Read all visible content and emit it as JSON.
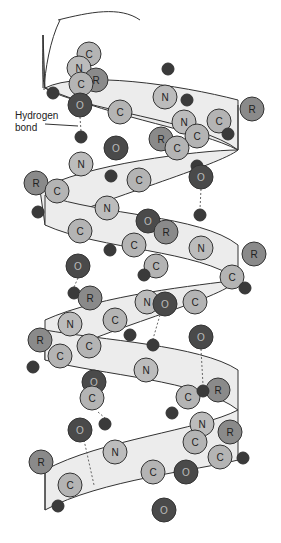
{
  "annotation": {
    "line1": "Hydrogen",
    "line2": "bond"
  },
  "colors": {
    "C": "#b4b4b4",
    "N": "#bcbcbc",
    "O": "#4a4a4a",
    "R": "#8a8a8a",
    "H": "#3a3a3a",
    "ribbon": "#ececec",
    "stroke": "#333333"
  },
  "atoms": [
    {
      "t": "C",
      "x": 89,
      "y": 54,
      "r": 12
    },
    {
      "t": "N",
      "x": 79,
      "y": 68,
      "r": 12
    },
    {
      "t": "R",
      "x": 96,
      "y": 80,
      "r": 12
    },
    {
      "t": "C",
      "x": 81,
      "y": 84,
      "r": 12
    },
    {
      "t": "H",
      "x": 53,
      "y": 93,
      "r": 6
    },
    {
      "t": "O",
      "x": 80,
      "y": 105,
      "r": 12
    },
    {
      "t": "C",
      "x": 120,
      "y": 112,
      "r": 12
    },
    {
      "t": "H",
      "x": 168,
      "y": 69,
      "r": 6
    },
    {
      "t": "N",
      "x": 165,
      "y": 97,
      "r": 12
    },
    {
      "t": "H",
      "x": 187,
      "y": 100,
      "r": 6
    },
    {
      "t": "R",
      "x": 252,
      "y": 109,
      "r": 12
    },
    {
      "t": "C",
      "x": 219,
      "y": 121,
      "r": 12
    },
    {
      "t": "H",
      "x": 228,
      "y": 134,
      "r": 6
    },
    {
      "t": "N",
      "x": 184,
      "y": 122,
      "r": 12
    },
    {
      "t": "C",
      "x": 197,
      "y": 136,
      "r": 12
    },
    {
      "t": "R",
      "x": 161,
      "y": 139,
      "r": 12
    },
    {
      "t": "C",
      "x": 177,
      "y": 148,
      "r": 12
    },
    {
      "t": "H",
      "x": 81,
      "y": 137,
      "r": 6
    },
    {
      "t": "O",
      "x": 116,
      "y": 148,
      "r": 12
    },
    {
      "t": "N",
      "x": 81,
      "y": 164,
      "r": 12
    },
    {
      "t": "H",
      "x": 111,
      "y": 176,
      "r": 6
    },
    {
      "t": "C",
      "x": 139,
      "y": 180,
      "r": 12
    },
    {
      "t": "H",
      "x": 197,
      "y": 166,
      "r": 6
    },
    {
      "t": "O",
      "x": 201,
      "y": 177,
      "r": 12
    },
    {
      "t": "R",
      "x": 36,
      "y": 183,
      "r": 12
    },
    {
      "t": "C",
      "x": 57,
      "y": 191,
      "r": 12
    },
    {
      "t": "H",
      "x": 38,
      "y": 212,
      "r": 6
    },
    {
      "t": "N",
      "x": 107,
      "y": 208,
      "r": 12
    },
    {
      "t": "H",
      "x": 200,
      "y": 215,
      "r": 6
    },
    {
      "t": "O",
      "x": 148,
      "y": 221,
      "r": 12
    },
    {
      "t": "R",
      "x": 166,
      "y": 232,
      "r": 12
    },
    {
      "t": "C",
      "x": 80,
      "y": 231,
      "r": 12
    },
    {
      "t": "N",
      "x": 201,
      "y": 248,
      "r": 12
    },
    {
      "t": "C",
      "x": 134,
      "y": 245,
      "r": 12
    },
    {
      "t": "H",
      "x": 110,
      "y": 250,
      "r": 6
    },
    {
      "t": "R",
      "x": 254,
      "y": 254,
      "r": 12
    },
    {
      "t": "C",
      "x": 156,
      "y": 266,
      "r": 12
    },
    {
      "t": "O",
      "x": 78,
      "y": 266,
      "r": 12
    },
    {
      "t": "C",
      "x": 232,
      "y": 277,
      "r": 12
    },
    {
      "t": "H",
      "x": 144,
      "y": 275,
      "r": 6
    },
    {
      "t": "H",
      "x": 245,
      "y": 288,
      "r": 6
    },
    {
      "t": "H",
      "x": 74,
      "y": 293,
      "r": 6
    },
    {
      "t": "R",
      "x": 90,
      "y": 298,
      "r": 12
    },
    {
      "t": "N",
      "x": 147,
      "y": 302,
      "r": 12
    },
    {
      "t": "O",
      "x": 165,
      "y": 304,
      "r": 12
    },
    {
      "t": "C",
      "x": 195,
      "y": 302,
      "r": 12
    },
    {
      "t": "N",
      "x": 70,
      "y": 324,
      "r": 12
    },
    {
      "t": "C",
      "x": 115,
      "y": 320,
      "r": 12
    },
    {
      "t": "H",
      "x": 130,
      "y": 335,
      "r": 6
    },
    {
      "t": "O",
      "x": 201,
      "y": 337,
      "r": 12
    },
    {
      "t": "R",
      "x": 40,
      "y": 340,
      "r": 12
    },
    {
      "t": "C",
      "x": 89,
      "y": 346,
      "r": 12
    },
    {
      "t": "H",
      "x": 153,
      "y": 345,
      "r": 6
    },
    {
      "t": "C",
      "x": 60,
      "y": 356,
      "r": 12
    },
    {
      "t": "H",
      "x": 33,
      "y": 367,
      "r": 6
    },
    {
      "t": "N",
      "x": 146,
      "y": 370,
      "r": 12
    },
    {
      "t": "O",
      "x": 94,
      "y": 382,
      "r": 12
    },
    {
      "t": "R",
      "x": 218,
      "y": 390,
      "r": 12
    },
    {
      "t": "C",
      "x": 188,
      "y": 397,
      "r": 12
    },
    {
      "t": "H",
      "x": 203,
      "y": 391,
      "r": 6
    },
    {
      "t": "C",
      "x": 92,
      "y": 398,
      "r": 12
    },
    {
      "t": "H",
      "x": 172,
      "y": 413,
      "r": 6
    },
    {
      "t": "N",
      "x": 202,
      "y": 424,
      "r": 12
    },
    {
      "t": "O",
      "x": 80,
      "y": 430,
      "r": 12
    },
    {
      "t": "H",
      "x": 105,
      "y": 424,
      "r": 6
    },
    {
      "t": "R",
      "x": 230,
      "y": 432,
      "r": 12
    },
    {
      "t": "C",
      "x": 195,
      "y": 442,
      "r": 12
    },
    {
      "t": "N",
      "x": 115,
      "y": 452,
      "r": 12
    },
    {
      "t": "C",
      "x": 220,
      "y": 457,
      "r": 12
    },
    {
      "t": "H",
      "x": 243,
      "y": 458,
      "r": 6
    },
    {
      "t": "R",
      "x": 41,
      "y": 462,
      "r": 12
    },
    {
      "t": "C",
      "x": 153,
      "y": 472,
      "r": 12
    },
    {
      "t": "O",
      "x": 186,
      "y": 472,
      "r": 12
    },
    {
      "t": "C",
      "x": 70,
      "y": 485,
      "r": 12
    },
    {
      "t": "H",
      "x": 58,
      "y": 506,
      "r": 6
    },
    {
      "t": "O",
      "x": 164,
      "y": 510,
      "r": 12
    }
  ]
}
